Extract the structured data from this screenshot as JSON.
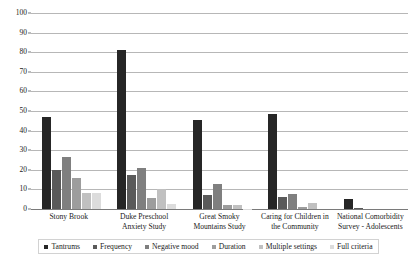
{
  "chart_data": {
    "type": "bar",
    "title": "",
    "xlabel": "",
    "ylabel": "",
    "ylim": [
      0,
      100
    ],
    "yticks": [
      0,
      10,
      20,
      30,
      40,
      50,
      60,
      70,
      80,
      90,
      100
    ],
    "grid": true,
    "legend_position": "bottom",
    "categories": [
      "Stony Brook",
      "Duke Preschool Anxiety Study",
      "Great Smoky Mountains Study",
      "Caring for Children in the Community",
      "National Comorbidity Survey - Adolescents"
    ],
    "series": [
      {
        "name": "Tantrums",
        "color": "#262626",
        "values": [
          47.2,
          81.0,
          45.5,
          48.7,
          5.0
        ]
      },
      {
        "name": "Frequency",
        "color": "#5a5a5a",
        "values": [
          20.0,
          17.5,
          6.9,
          6.1,
          0.6
        ]
      },
      {
        "name": "Negative mood",
        "color": "#7f7f7f",
        "values": [
          26.7,
          20.8,
          12.6,
          7.9,
          0.0
        ]
      },
      {
        "name": "Duration",
        "color": "#9d9d9d",
        "values": [
          16.0,
          5.7,
          2.2,
          1.1,
          0.0
        ]
      },
      {
        "name": "Multiple settings",
        "color": "#c0c0c0",
        "values": [
          8.3,
          10.0,
          2.3,
          3.2,
          0.0
        ]
      },
      {
        "name": "Full criteria",
        "color": "#dcdcdc",
        "values": [
          8.3,
          2.7,
          0.2,
          0.0,
          0.0
        ]
      }
    ]
  },
  "axis": {
    "y_tick_labels": [
      "0",
      "10",
      "20",
      "30",
      "40",
      "50",
      "60",
      "70",
      "80",
      "90",
      "100"
    ]
  },
  "colors": {
    "gridline": "#b7b7b7",
    "axis": "#7a7a7a",
    "text": "#1a1a1a",
    "legend_border": "#d2d2d2",
    "background": "#ffffff"
  }
}
